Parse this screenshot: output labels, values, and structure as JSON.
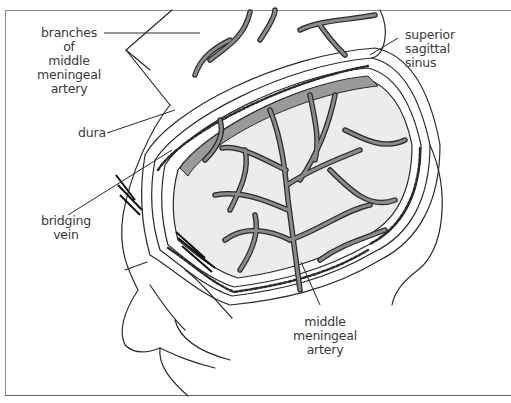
{
  "figure": {
    "type": "anatomical illustration",
    "colors": {
      "line": "#2a2a2a",
      "vessel_fill": "#8a8a8a",
      "sinus_fill": "#9a9a9a",
      "dura_fill": "#ececec",
      "frame": "#8a8a8a",
      "label_text": "#3a3a3a"
    }
  },
  "labels": {
    "branches": [
      "branches of",
      "middle",
      "meningeal",
      "artery"
    ],
    "sinus": [
      "superior",
      "sagittal",
      "sinus"
    ],
    "dura": [
      "dura"
    ],
    "bridging": [
      "bridging",
      "vein"
    ],
    "artery": [
      "middle",
      "meningeal",
      "artery"
    ]
  }
}
